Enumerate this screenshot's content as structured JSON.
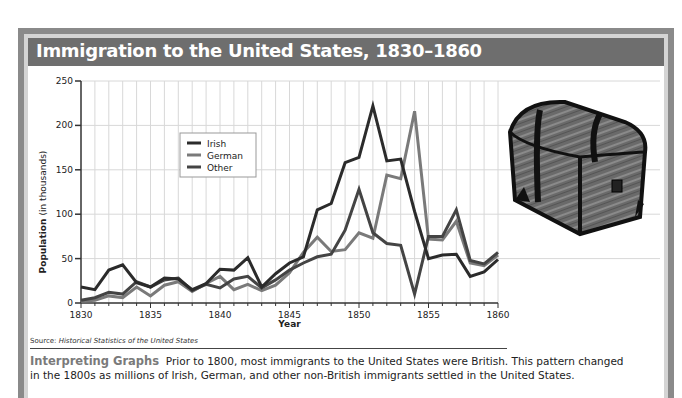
{
  "header": {
    "title": "Immigration to the United States, 1830–1860"
  },
  "source": {
    "label": "Source:",
    "text": "Historical Statistics of the United States"
  },
  "interpreting": {
    "heading": "Interpreting Graphs",
    "body": "Prior to 1800, most immigrants to the United States were British. This pattern changed in the 1800s as millions of Irish, German, and other non-British immigrants settled in the United States."
  },
  "image": {
    "icon": "treasure-chest-icon",
    "description": "Wooden trunk with iron bands"
  },
  "colors": {
    "irish": "#2b2b2b",
    "german": "#7a7a7a",
    "other": "#444444",
    "header_bg": "#6e6e6e",
    "frame": "#8a8a8a"
  },
  "chart_data": {
    "type": "line",
    "title": "Immigration to the United States, 1830–1860",
    "xlabel": "Year",
    "ylabel": "Population (in thousands)",
    "xlim": [
      1830,
      1860
    ],
    "ylim": [
      0,
      250
    ],
    "x_ticks": [
      1830,
      1835,
      1840,
      1845,
      1850,
      1855,
      1860
    ],
    "y_ticks": [
      0,
      50,
      100,
      150,
      200,
      250
    ],
    "grid": true,
    "legend_position": "upper-left (inside plot, near 1835–1840)",
    "x": [
      1830,
      1831,
      1832,
      1833,
      1834,
      1835,
      1836,
      1837,
      1838,
      1839,
      1840,
      1841,
      1842,
      1843,
      1844,
      1845,
      1846,
      1847,
      1848,
      1849,
      1850,
      1851,
      1852,
      1853,
      1854,
      1855,
      1856,
      1857,
      1858,
      1859,
      1860
    ],
    "series": [
      {
        "name": "Irish",
        "values": [
          18,
          15,
          37,
          43,
          23,
          18,
          28,
          27,
          15,
          22,
          38,
          37,
          51,
          18,
          33,
          45,
          52,
          105,
          112,
          158,
          164,
          222,
          160,
          162,
          103,
          50,
          54,
          55,
          30,
          35,
          49
        ]
      },
      {
        "name": "German",
        "values": [
          2,
          3,
          8,
          6,
          18,
          8,
          20,
          24,
          13,
          22,
          30,
          15,
          21,
          14,
          20,
          34,
          57,
          74,
          58,
          60,
          79,
          73,
          144,
          140,
          216,
          72,
          71,
          92,
          45,
          42,
          54
        ]
      },
      {
        "name": "Other",
        "values": [
          3,
          6,
          12,
          10,
          24,
          18,
          26,
          28,
          14,
          21,
          17,
          27,
          30,
          17,
          26,
          37,
          45,
          52,
          55,
          82,
          128,
          79,
          67,
          65,
          10,
          75,
          75,
          105,
          48,
          44,
          57
        ]
      }
    ]
  }
}
